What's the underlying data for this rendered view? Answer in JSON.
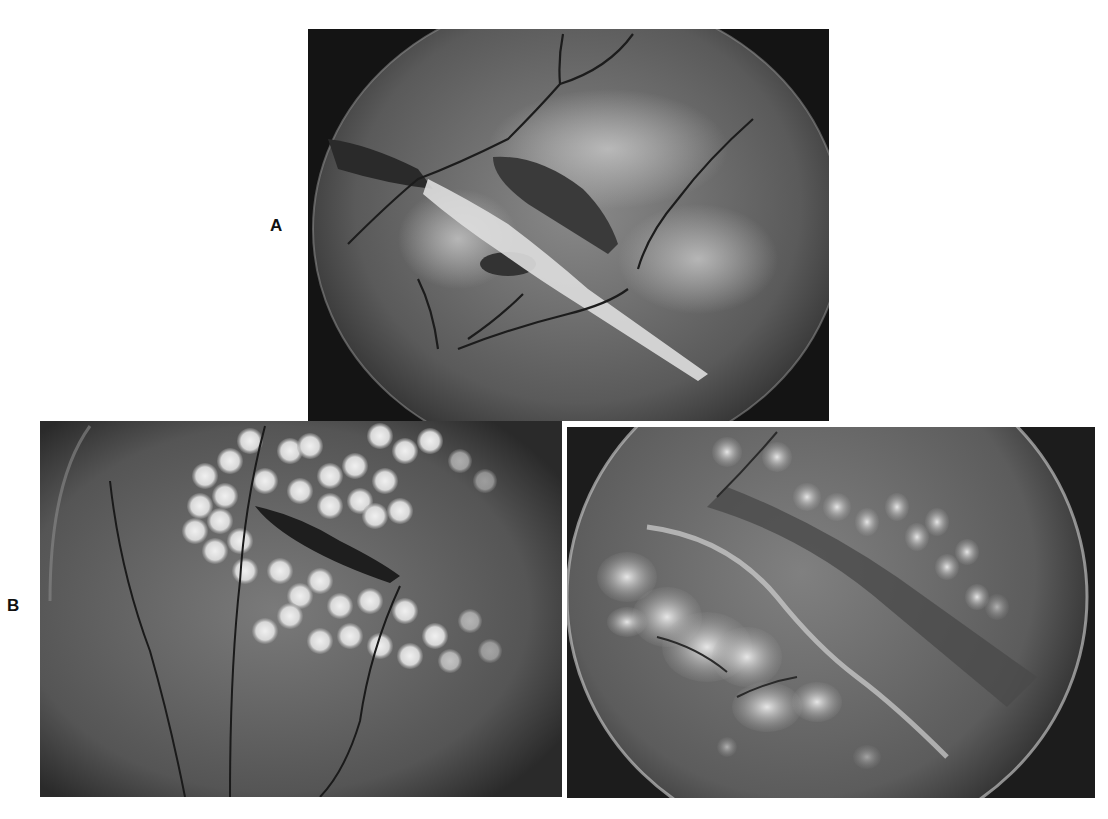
{
  "figure": {
    "panels": [
      {
        "id": "A",
        "label": "A",
        "description": "Fundus photograph showing a retinal tear with a dark elongated break and bright white band crossing diagonally; branching retinal vessels across a mottled background within circular field.",
        "colors": {
          "background": "#1a1a1a",
          "fundus": "#6e6e6e",
          "highlight": "#e8e8e8",
          "vessel": "#222222"
        }
      },
      {
        "id": "B",
        "label": "B",
        "subpanels": [
          {
            "id": "B-left",
            "description": "Fundus photograph with numerous round bright laser photocoagulation spots surrounding a dark elongated retinal break; vessels crossing vertically.",
            "colors": {
              "background": "#2a2a2a",
              "fundus": "#6a6a6a",
              "spot": "#e6e6e6",
              "vessel": "#1e1e1e"
            }
          },
          {
            "id": "B-right",
            "description": "Fundus photograph with confluent bright laser scars along the lower edge of a diagonal retinal break, and rows of fainter spots above; circular field edge visible.",
            "colors": {
              "background": "#1c1c1c",
              "fundus": "#7a7a7a",
              "spot": "#dcdcdc",
              "vessel": "#2a2a2a"
            }
          }
        ]
      }
    ]
  }
}
